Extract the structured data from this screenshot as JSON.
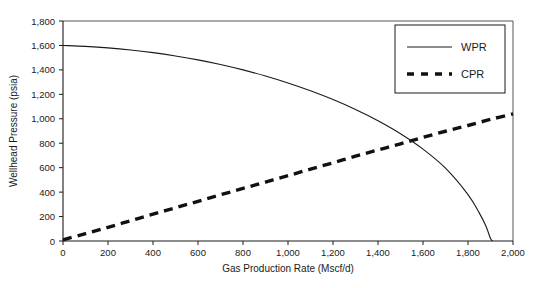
{
  "chart_data": {
    "type": "line",
    "title": "",
    "xlabel": "Gas Production Rate (Mscf/d)",
    "ylabel": "Wellhead Pressure (psia)",
    "xlim": [
      0,
      2000
    ],
    "ylim": [
      0,
      1800
    ],
    "xticks": [
      0,
      200,
      400,
      600,
      800,
      1000,
      1200,
      1400,
      1600,
      1800,
      2000
    ],
    "xtick_labels": [
      "0",
      "200",
      "400",
      "600",
      "800",
      "1,000",
      "1,200",
      "1,400",
      "1,600",
      "1,800",
      "2,000"
    ],
    "yticks": [
      0,
      200,
      400,
      600,
      800,
      1000,
      1200,
      1400,
      1600,
      1800
    ],
    "ytick_labels": [
      "0",
      "200",
      "400",
      "600",
      "800",
      "1,000",
      "1,200",
      "1,400",
      "1,600",
      "1,800"
    ],
    "grid": false,
    "legend_position": "top-right",
    "series": [
      {
        "name": "WPR",
        "style": "solid",
        "color": "#1a1a1a",
        "x": [
          0,
          100,
          200,
          300,
          400,
          500,
          600,
          700,
          800,
          900,
          1000,
          1100,
          1200,
          1300,
          1400,
          1500,
          1600,
          1700,
          1800,
          1850,
          1880,
          1900,
          1910
        ],
        "values": [
          1600,
          1592,
          1580,
          1563,
          1541,
          1514,
          1482,
          1444,
          1400,
          1350,
          1293,
          1229,
          1157,
          1076,
          984,
          878,
          752,
          596,
          380,
          230,
          120,
          20,
          0
        ]
      },
      {
        "name": "CPR",
        "style": "dashed",
        "color": "#111111",
        "x": [
          0,
          100,
          200,
          300,
          400,
          500,
          600,
          700,
          800,
          900,
          1000,
          1100,
          1200,
          1300,
          1400,
          1500,
          1600,
          1700,
          1800,
          1900,
          2000
        ],
        "values": [
          10,
          60,
          112,
          166,
          220,
          272,
          325,
          378,
          430,
          482,
          534,
          588,
          640,
          694,
          745,
          795,
          848,
          898,
          945,
          995,
          1040
        ]
      }
    ],
    "intersection": {
      "x": 1500,
      "y": 800
    }
  },
  "legend": {
    "items": [
      {
        "label": "WPR"
      },
      {
        "label": "CPR"
      }
    ]
  },
  "axes": {
    "x_title": "Gas Production Rate (Mscf/d)",
    "y_title": "Wellhead Pressure (psia)"
  }
}
